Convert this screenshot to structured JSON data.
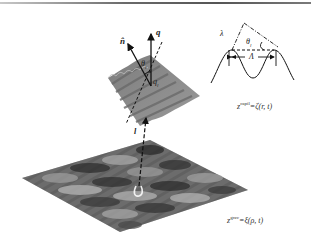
{
  "figure": {
    "top_rule": true,
    "labels": {
      "n_hat": "n̂",
      "q": "q",
      "theta_l_upper": "θ",
      "theta_l_upper_sub": "l",
      "q_l": "q",
      "q_l_sub": "l",
      "l_vector": "l",
      "lambda": "λ",
      "theta_l_right": "θ",
      "theta_l_right_sub": "l",
      "Lambda": "Λ"
    },
    "equations": {
      "capillary": {
        "lhs": "z",
        "sup": "capil",
        "rhs": "=ζ(r, t)"
      },
      "gravity": {
        "lhs": "z",
        "sup": "grav",
        "rhs": "=ξ(ρ, t)"
      }
    },
    "colors": {
      "capillary_patch": "#8a8a8a",
      "gravity_surface_dark": "#3a3a3a",
      "gravity_surface_light": "#b0b0b0",
      "line": "#111111"
    }
  }
}
